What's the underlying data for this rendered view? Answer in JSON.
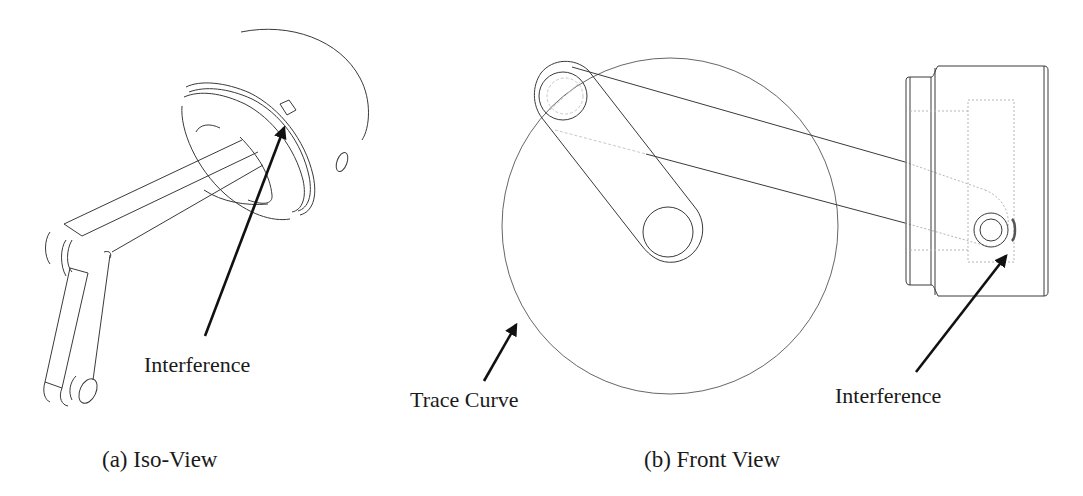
{
  "figure": {
    "panels": [
      {
        "id": "a",
        "caption": "(a) Iso-View",
        "callouts": [
          {
            "text": "Interference"
          }
        ]
      },
      {
        "id": "b",
        "caption": "(b) Front View",
        "callouts": [
          {
            "text": "Trace Curve"
          },
          {
            "text": "Interference"
          }
        ]
      }
    ]
  },
  "colors": {
    "background": "#ffffff",
    "line": "#3a3a3a",
    "hidden_line": "#b5b5b5",
    "arrow": "#111111",
    "text": "#1a1a1a"
  }
}
